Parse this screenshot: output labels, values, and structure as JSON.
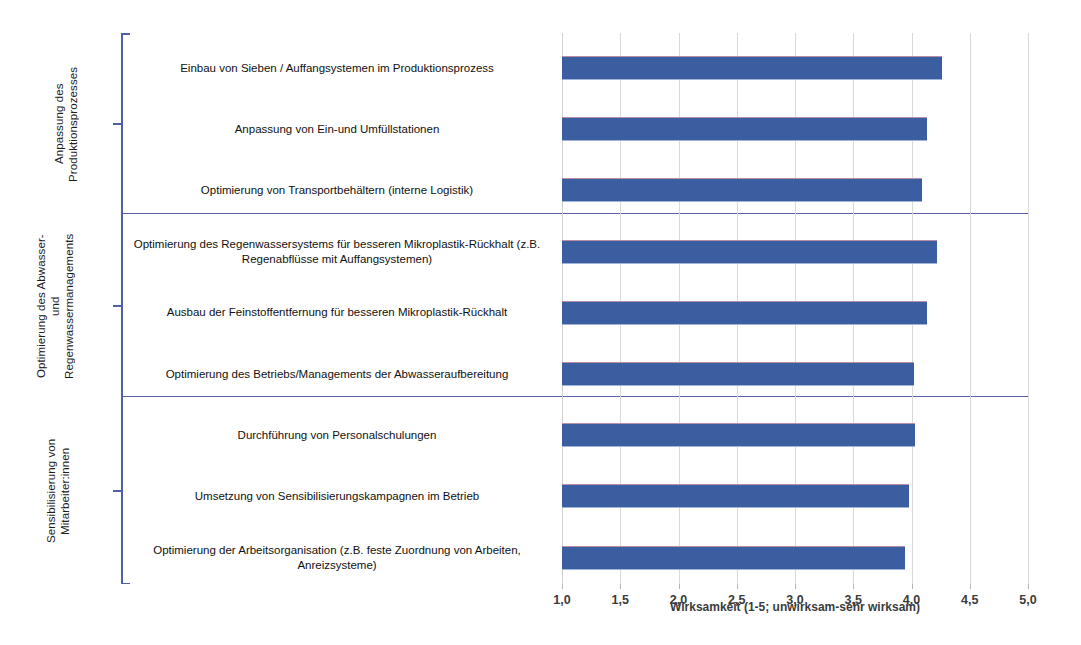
{
  "chart_data": {
    "type": "bar",
    "orientation": "horizontal",
    "title": "",
    "xlabel": "Wirksamkeit (1-5; unwirksam-sehr wirksam)",
    "ylabel": "",
    "xlim": [
      1.0,
      5.0
    ],
    "xticks": [
      1.0,
      1.5,
      2.0,
      2.5,
      3.0,
      3.5,
      4.0,
      4.5,
      5.0
    ],
    "xticklabels": [
      "1,0",
      "1,5",
      "2,0",
      "2,5",
      "3,0",
      "3,5",
      "4,0",
      "4,5",
      "5,0"
    ],
    "grid": true,
    "legend": false,
    "bar_color": "#3b5ea0",
    "categories": [
      "Einbau von Sieben / Auffangsystemen im Produktionsprozess",
      "Anpassung von Ein-und Umfüllstationen",
      "Optimierung von Transportbehältern (interne Logistik)",
      "Optimierung des Regenwassersystems für besseren Mikroplastik-Rückhalt (z.B. Regenabflüsse mit Auffangsystemen)",
      "Ausbau der Feinstoffentfernung für besseren Mikroplastik-Rückhalt",
      "Optimierung des Betriebs/Managements der Abwasseraufbereitung",
      "Durchführung von Personalschulungen",
      "Umsetzung von Sensibilisierungskampagnen im Betrieb",
      "Optimierung der Arbeitsorganisation (z.B. feste Zuordnung von Arbeiten, Anreizsysteme)"
    ],
    "values": [
      4.26,
      4.13,
      4.09,
      4.22,
      4.13,
      4.02,
      4.03,
      3.98,
      3.94
    ],
    "groups": [
      {
        "label": "Anpassung des Produktionsprozesses",
        "categories": [
          "Einbau von Sieben / Auffangsystemen im Produktionsprozess",
          "Anpassung von Ein-und Umfüllstationen",
          "Optimierung von Transportbehältern (interne Logistik)"
        ],
        "values": [
          4.26,
          4.13,
          4.09
        ]
      },
      {
        "label": "Optimierung des Abwasser- und Regenwassermanagements",
        "categories": [
          "Optimierung des Regenwassersystems für besseren Mikroplastik-Rückhalt (z.B. Regenabflüsse mit Auffangsystemen)",
          "Ausbau der Feinstoffentfernung für besseren Mikroplastik-Rückhalt",
          "Optimierung des Betriebs/Managements der Abwasseraufbereitung"
        ],
        "values": [
          4.22,
          4.13,
          4.02
        ]
      },
      {
        "label": "Sensibilisierung von Mitarbeiter:innen",
        "categories": [
          "Durchführung von Personalschulungen",
          "Umsetzung von Sensibilisierungskampagnen im Betrieb",
          "Optimierung der Arbeitsorganisation (z.B. feste Zuordnung von Arbeiten, Anreizsysteme)"
        ],
        "values": [
          4.03,
          3.98,
          3.94
        ]
      }
    ]
  },
  "group_labels": {
    "g0": "Anpassung des\nProduktionsprozesses",
    "g1": "Optimierung des Abwasser-\nund\nRegenwassermanagements",
    "g2": "Sensibilisierung von\nMitarbeiter:innen"
  },
  "bar_labels": {
    "b0": "Einbau von Sieben / Auffangsystemen im Produktionsprozess",
    "b1": "Anpassung von Ein-und Umfüllstationen",
    "b2": "Optimierung von Transportbehältern (interne Logistik)",
    "b3": "Optimierung des Regenwassersystems für besseren Mikroplastik-Rückhalt (z.B. Regenabflüsse mit Auffangsystemen)",
    "b4": "Ausbau der Feinstoffentfernung für besseren Mikroplastik-Rückhalt",
    "b5": "Optimierung des Betriebs/Managements der Abwasseraufbereitung",
    "b6": "Durchführung von Personalschulungen",
    "b7": "Umsetzung von Sensibilisierungskampagnen im Betrieb",
    "b8": "Optimierung der Arbeitsorganisation (z.B. feste Zuordnung von Arbeiten, Anreizsysteme)"
  },
  "xaxis": {
    "title": "Wirksamkeit (1-5; unwirksam-sehr wirksam)",
    "ticklabels": [
      "1,0",
      "1,5",
      "2,0",
      "2,5",
      "3,0",
      "3,5",
      "4,0",
      "4,5",
      "5,0"
    ]
  },
  "colors": {
    "bar": "#3b5ea0",
    "axis": "#4f5fa8",
    "separator": "#5a5aa6",
    "gridline": "#d9d9d9"
  }
}
